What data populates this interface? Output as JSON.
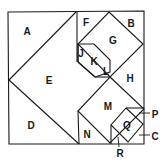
{
  "diagram": {
    "kind": "square dissection puzzle",
    "stroke_color": "#1a1a1a",
    "background": "#ffffff",
    "lines": [
      {
        "id": "outer-square",
        "points": [
          [
            8,
            12
          ],
          [
            144,
            11
          ],
          [
            144,
            144
          ],
          [
            9,
            144
          ]
        ],
        "closed": true
      },
      {
        "id": "A-E-edge",
        "points": [
          [
            76,
            12
          ],
          [
            9,
            80
          ]
        ]
      },
      {
        "id": "E-D-edge",
        "points": [
          [
            9,
            80
          ],
          [
            79,
            144
          ]
        ]
      },
      {
        "id": "F-left-edge",
        "points": [
          [
            77,
            12
          ],
          [
            77,
            62
          ]
        ]
      },
      {
        "id": "G-diamond",
        "points": [
          [
            109,
            12
          ],
          [
            143,
            44
          ],
          [
            110,
            77
          ],
          [
            78,
            44
          ]
        ],
        "closed": true
      },
      {
        "id": "K-hexagon",
        "points": [
          [
            78,
            44
          ],
          [
            94,
            44
          ],
          [
            110,
            60
          ],
          [
            110,
            72
          ],
          [
            95,
            77
          ],
          [
            78,
            62
          ]
        ],
        "closed": true
      },
      {
        "id": "J-edge",
        "points": [
          [
            78,
            62
          ],
          [
            78,
            44
          ]
        ]
      },
      {
        "id": "L-edge",
        "points": [
          [
            95,
            77
          ],
          [
            110,
            77
          ]
        ]
      },
      {
        "id": "E-K-edge",
        "points": [
          [
            78,
            62
          ],
          [
            95,
            77
          ]
        ]
      },
      {
        "id": "M-diamond",
        "points": [
          [
            110,
            77
          ],
          [
            144,
            109
          ],
          [
            110,
            143
          ],
          [
            78,
            111
          ]
        ],
        "closed": true
      },
      {
        "id": "N-left-edge",
        "points": [
          [
            78,
            111
          ],
          [
            79,
            144
          ]
        ]
      },
      {
        "id": "Q-diamond",
        "points": [
          [
            126,
            108
          ],
          [
            143,
            124
          ],
          [
            128,
            142
          ],
          [
            111,
            125
          ]
        ],
        "closed": true
      },
      {
        "id": "P-top-edge",
        "points": [
          [
            126,
            108
          ],
          [
            144,
            108
          ]
        ]
      },
      {
        "id": "R-left-edge",
        "points": [
          [
            111,
            125
          ],
          [
            111,
            144
          ]
        ]
      }
    ],
    "labels": [
      {
        "text": "A",
        "x": 27,
        "y": 31
      },
      {
        "text": "B",
        "x": 131,
        "y": 23
      },
      {
        "text": "C",
        "x": 155,
        "y": 136
      },
      {
        "text": "D",
        "x": 31,
        "y": 125
      },
      {
        "text": "E",
        "x": 49,
        "y": 80
      },
      {
        "text": "F",
        "x": 86,
        "y": 22
      },
      {
        "text": "G",
        "x": 113,
        "y": 40
      },
      {
        "text": "H",
        "x": 130,
        "y": 78
      },
      {
        "text": "J",
        "x": 81,
        "y": 53
      },
      {
        "text": "K",
        "x": 94,
        "y": 61
      },
      {
        "text": "L",
        "x": 106,
        "y": 71
      },
      {
        "text": "M",
        "x": 108,
        "y": 106
      },
      {
        "text": "N",
        "x": 87,
        "y": 134
      },
      {
        "text": "P",
        "x": 155,
        "y": 114
      },
      {
        "text": "Q",
        "x": 127,
        "y": 125
      },
      {
        "text": "R",
        "x": 120,
        "y": 153
      }
    ],
    "leaders": [
      {
        "for": "P",
        "from": [
          139,
          113
        ],
        "to": [
          150,
          113
        ]
      },
      {
        "for": "C",
        "from": [
          139,
          135
        ],
        "to": [
          150,
          135
        ]
      },
      {
        "for": "R",
        "from": [
          118,
          137
        ],
        "to": [
          119,
          147
        ]
      }
    ]
  }
}
